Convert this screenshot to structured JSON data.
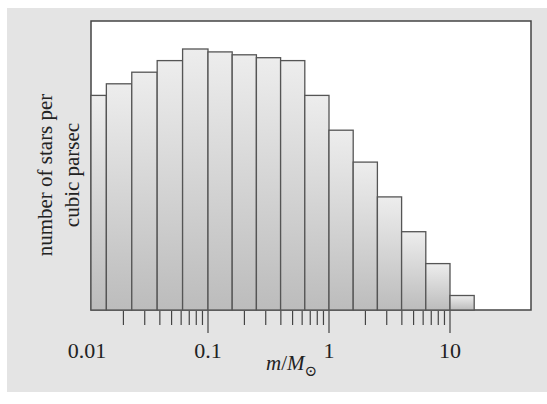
{
  "chart_data": {
    "type": "bar",
    "title": "",
    "xlabel": "m/M_sun",
    "xlabel_parts": {
      "m": "m",
      "slash": "/",
      "M": "M",
      "sub": "⊙"
    },
    "ylabel_lines": [
      "number of stars per",
      "cubic parsec"
    ],
    "x_scale": "log",
    "x_tick_labels": [
      "0.01",
      "0.1",
      "1",
      "10"
    ],
    "x_range": [
      0.0089,
      20
    ],
    "y_ticks": "none",
    "grid": false,
    "legend": "none",
    "bins_log10_edges": [
      -2.05,
      -1.84,
      -1.63,
      -1.42,
      -1.21,
      -1.0,
      -0.8,
      -0.6,
      -0.4,
      -0.2,
      0.0,
      0.2,
      0.4,
      0.6,
      0.8,
      1.0,
      1.2
    ],
    "categories": [
      "0.009-0.014",
      "0.014-0.023",
      "0.023-0.038",
      "0.038-0.062",
      "0.062-0.1",
      "0.1-0.16",
      "0.16-0.25",
      "0.25-0.4",
      "0.4-0.63",
      "0.63-1",
      "1-1.6",
      "1.6-2.5",
      "2.5-4",
      "4-6.3",
      "6.3-10",
      "10-16"
    ],
    "values": [
      74,
      78,
      82,
      86,
      90,
      89,
      88,
      87,
      86,
      74,
      62,
      51,
      39,
      27,
      16,
      5
    ],
    "value_units": "relative (arbitrary, no y-axis scale shown)",
    "ylim": [
      0,
      100
    ]
  },
  "colors": {
    "panel_bg": "#e4e4e4",
    "plot_bg": "#ffffff",
    "bar_fill_top": "#ececec",
    "bar_fill_bottom": "#bdbdbd",
    "bar_stroke": "#555555",
    "axis": "#444444"
  }
}
